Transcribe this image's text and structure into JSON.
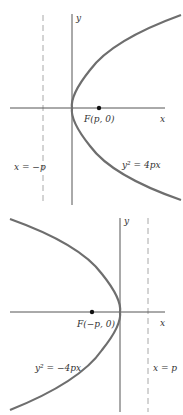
{
  "colors": {
    "curve": "#6e6e6e",
    "axis": "#555555",
    "directrix": "#a8a8a8",
    "focus": "#111111",
    "text": "#333333"
  },
  "figures": [
    {
      "name": "parabola-opening-right",
      "equation": "y² = 4px",
      "focus_label": "F(p, 0)",
      "directrix_label": "x = −p",
      "x_axis_label": "x",
      "y_axis_label": "y"
    },
    {
      "name": "parabola-opening-left",
      "equation": "y² = −4px",
      "focus_label": "F(−p, 0)",
      "directrix_label": "x = p",
      "x_axis_label": "x",
      "y_axis_label": "y"
    }
  ]
}
